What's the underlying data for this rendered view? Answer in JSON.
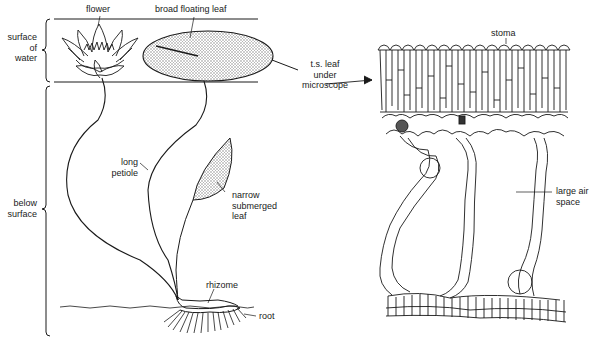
{
  "diagram": {
    "plant_labels": {
      "flower": "flower",
      "broad_leaf": "broad floating leaf",
      "surface_zone": [
        "surface",
        "of",
        "water"
      ],
      "below_zone": [
        "below",
        "surface"
      ],
      "long_petiole": [
        "long",
        "petiole"
      ],
      "narrow_leaf": [
        "narrow",
        "submerged",
        "leaf"
      ],
      "rhizome": "rhizome",
      "root": "root"
    },
    "section_labels": {
      "ts_leaf": [
        "t.s. leaf",
        "under",
        "microscope"
      ],
      "stoma": "stoma",
      "air_space": [
        "large air",
        "space"
      ]
    },
    "colors": {
      "line": "#1a1a1a",
      "background": "#ffffff",
      "stipple": "#8a8a8a"
    }
  }
}
